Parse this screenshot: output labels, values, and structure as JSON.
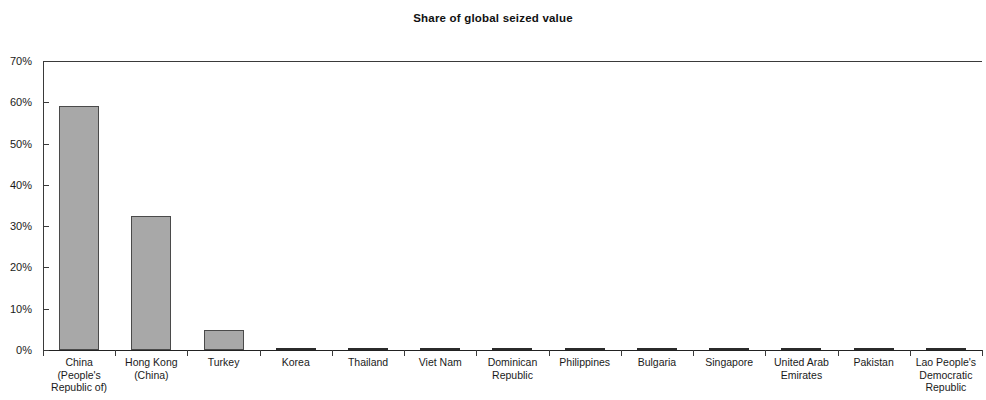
{
  "chart_data": {
    "type": "bar",
    "title": "Share of global seized value",
    "xlabel": "",
    "ylabel": "",
    "ylim": [
      0,
      70
    ],
    "ytick_labels": [
      "0%",
      "10%",
      "20%",
      "30%",
      "40%",
      "50%",
      "60%",
      "70%"
    ],
    "ytick_values": [
      0,
      10,
      20,
      30,
      40,
      50,
      60,
      70
    ],
    "grid": false,
    "legend": "none",
    "bar_color": "#a8a8a8",
    "bar_border_color": "#4a4a4a",
    "axis_color": "#3a3a3a",
    "categories": [
      "China\n(People's\nRepublic of)",
      "Hong Kong\n(China)",
      "Turkey",
      "Korea",
      "Thailand",
      "Viet Nam",
      "Dominican\nRepublic",
      "Philippines",
      "Bulgaria",
      "Singapore",
      "United Arab\nEmirates",
      "Pakistan",
      "Lao People's\nDemocratic\nRepublic"
    ],
    "values": [
      59.2,
      32.5,
      4.8,
      0.5,
      0.5,
      0.4,
      0.4,
      0.4,
      0.4,
      0.4,
      0.3,
      0.3,
      0.3
    ]
  }
}
